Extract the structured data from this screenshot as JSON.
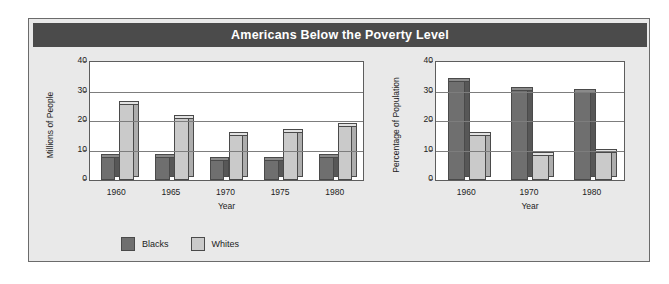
{
  "title": "Americans Below the Poverty Level",
  "colors": {
    "banner": "#4b4b4b",
    "panel": "#e9e9e9",
    "plot_background": "#ffffff",
    "blacks": "#6f6f6f",
    "whites": "#cacaca",
    "gridline": "#7d7d7d",
    "text": "#1c1c1c"
  },
  "legend": {
    "items": [
      {
        "label": "Blacks",
        "swatch": "blacks"
      },
      {
        "label": "Whites",
        "swatch": "whites"
      }
    ]
  },
  "chart_data": [
    {
      "id": "millions",
      "type": "bar",
      "title": "Americans Below the Poverty Level",
      "xlabel": "Year",
      "ylabel": "Millions of People",
      "categories": [
        "1960",
        "1965",
        "1970",
        "1975",
        "1980"
      ],
      "yticks": [
        0,
        10,
        20,
        30,
        40
      ],
      "ylim": [
        0,
        40
      ],
      "grid": true,
      "legend_position": "bottom-left",
      "series": [
        {
          "name": "Blacks",
          "values": [
            8,
            8,
            7,
            7,
            8
          ]
        },
        {
          "name": "Whites",
          "values": [
            27,
            22,
            16,
            17,
            19
          ]
        }
      ]
    },
    {
      "id": "percentage",
      "type": "bar",
      "title": "Americans Below the Poverty Level",
      "xlabel": "Year",
      "ylabel": "Percentage of Population",
      "categories": [
        "1960",
        "1970",
        "1980"
      ],
      "yticks": [
        0,
        10,
        20,
        30,
        40
      ],
      "ylim": [
        0,
        40
      ],
      "grid": true,
      "legend_position": "bottom-left",
      "series": [
        {
          "name": "Blacks",
          "values": [
            35,
            32,
            31
          ]
        },
        {
          "name": "Whites",
          "values": [
            16,
            9,
            10
          ]
        }
      ]
    }
  ]
}
